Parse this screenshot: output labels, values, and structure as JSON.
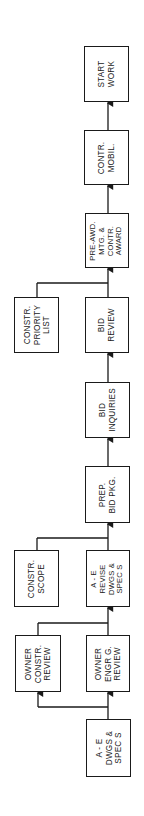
{
  "diagram": {
    "orientation": "rotated-90-ccw, flow bottom-to-top",
    "line_color": "#1a1a1a",
    "boxes": [
      {
        "id": "start-work",
        "lines": [
          "START",
          "WORK"
        ]
      },
      {
        "id": "contr-mobil",
        "lines": [
          "CONTR.",
          "MOBIL."
        ]
      },
      {
        "id": "pre-awd",
        "lines": [
          "PRE-AWD.",
          "MTG. &",
          "CONTR.",
          "AWARD"
        ]
      },
      {
        "id": "constr-priority",
        "lines": [
          "CONSTR.",
          "PRIORITY",
          "LIST"
        ]
      },
      {
        "id": "bid-review",
        "lines": [
          "BID",
          "REVIEW"
        ]
      },
      {
        "id": "bid-inquiries",
        "lines": [
          "BID",
          "INQUIRIES"
        ]
      },
      {
        "id": "prep-bid",
        "lines": [
          "PREP.",
          "BID PKG."
        ]
      },
      {
        "id": "constr-scope",
        "lines": [
          "CONSTR.",
          "SCOPE"
        ]
      },
      {
        "id": "ae-revise",
        "lines": [
          "A - E",
          "REVISE",
          "DWGS &",
          "SPEC S"
        ]
      },
      {
        "id": "owner-constr",
        "lines": [
          "OWNER",
          "CONSTR.",
          "REVIEW"
        ]
      },
      {
        "id": "owner-engrg",
        "lines": [
          "OWNER",
          "ENGR G.",
          "REVIEW"
        ]
      },
      {
        "id": "ae-dwgs",
        "lines": [
          "A - E",
          "DWGS &",
          "SPEC S"
        ]
      }
    ]
  }
}
